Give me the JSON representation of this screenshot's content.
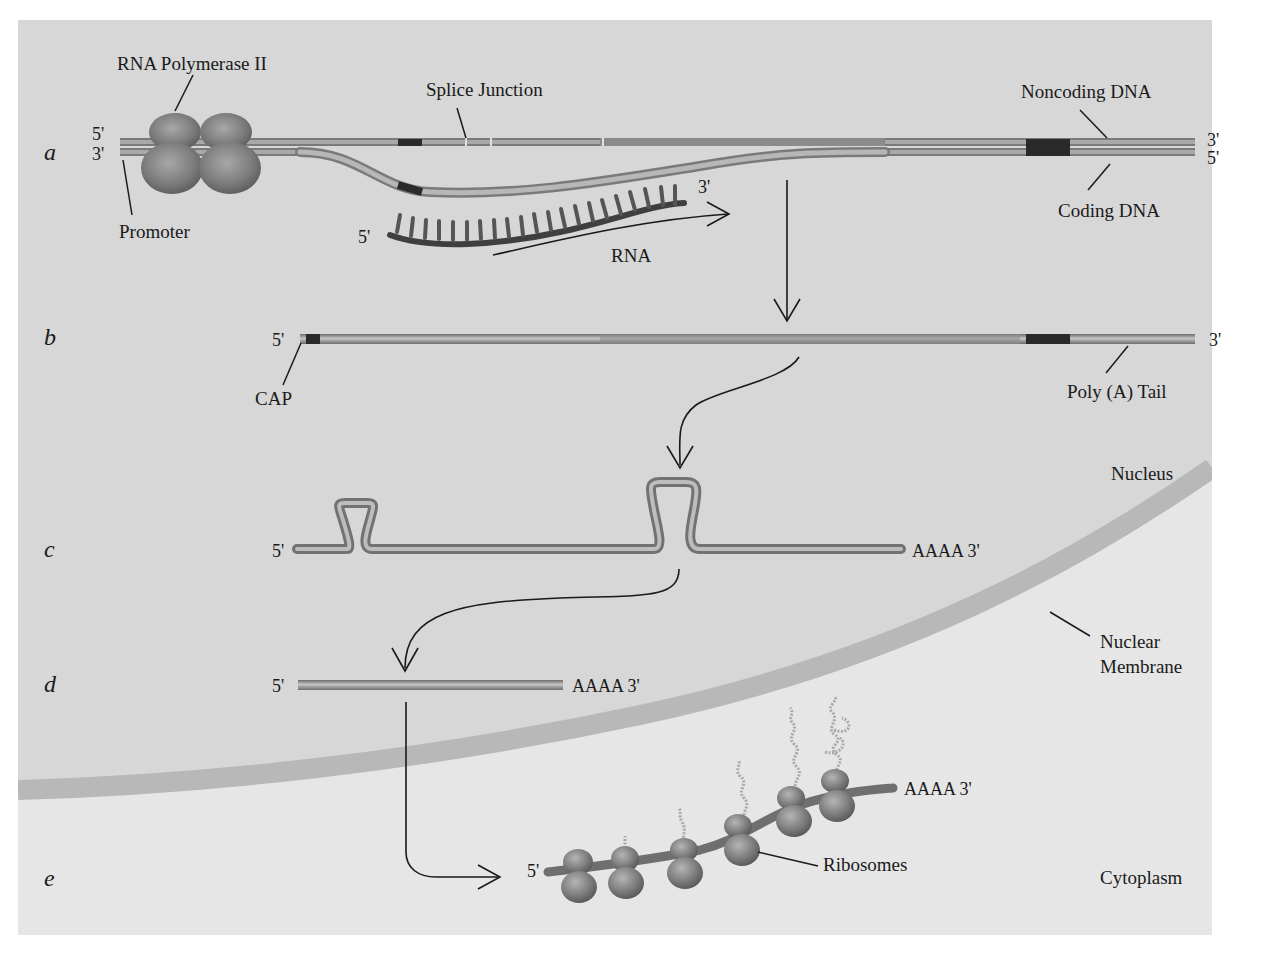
{
  "figure": {
    "colors": {
      "panel_nucleus": "#d6d6d6",
      "panel_cytoplasm": "#e4e4e4",
      "membrane": "#b9b9b9",
      "strand_light": "#b3b3b3",
      "strand_dark": "#707070",
      "exon_dark": "#2a2a2a",
      "ribosome": "#7f7f7f",
      "text": "#1a1a1a"
    },
    "rows": [
      {
        "letter": "a"
      },
      {
        "letter": "b"
      },
      {
        "letter": "c"
      },
      {
        "letter": "d"
      },
      {
        "letter": "e"
      }
    ],
    "row_a": {
      "top_strand_left_end": "5'",
      "bottom_strand_left_end": "3'",
      "top_strand_right_end": "3'",
      "bottom_strand_right_end": "5'",
      "rna_left_end": "5'",
      "rna_right_end": "3'",
      "labels": {
        "polymerase": "RNA Polymerase II",
        "promoter": "Promoter",
        "splice_junction": "Splice Junction",
        "noncoding": "Noncoding DNA",
        "coding": "Coding DNA",
        "rna": "RNA"
      }
    },
    "row_b": {
      "left_end": "5'",
      "right_end": "3'",
      "labels": {
        "cap": "CAP",
        "poly_a": "Poly (A) Tail"
      }
    },
    "row_c": {
      "left_end": "5'",
      "right_end": "AAAA 3'"
    },
    "row_d": {
      "left_end": "5'",
      "right_end": "AAAA 3'"
    },
    "row_e": {
      "left_end": "5'",
      "right_end": "AAAA 3'",
      "labels": {
        "ribosomes": "Ribosomes"
      },
      "ribosome_count": 6
    },
    "regions": {
      "nucleus": "Nucleus",
      "membrane": "Nuclear",
      "membrane_line2": "Membrane",
      "cytoplasm": "Cytoplasm"
    }
  }
}
